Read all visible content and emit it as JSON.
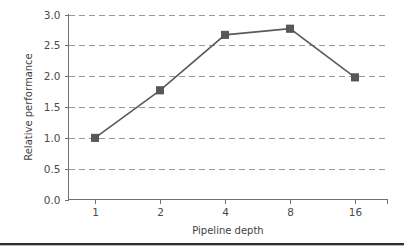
{
  "chart_data": {
    "type": "line",
    "title": "",
    "xlabel": "Pipeline depth",
    "ylabel": "Relative performance",
    "categories": [
      "1",
      "2",
      "4",
      "8",
      "16"
    ],
    "values": [
      1.0,
      1.77,
      2.67,
      2.77,
      1.98
    ],
    "x_tick_labels": [
      "1",
      "2",
      "4",
      "8",
      "16"
    ],
    "y_tick_labels": [
      "0.0",
      "0.5",
      "1.0",
      "1.5",
      "2.0",
      "2.5",
      "3.0"
    ],
    "y_tick_values": [
      0.0,
      0.5,
      1.0,
      1.5,
      2.0,
      2.5,
      3.0
    ],
    "ylim": [
      0.0,
      3.0
    ],
    "grid": "horizontal-dashed",
    "legend": "none",
    "marker": "square",
    "line_color": "#5a5a5a",
    "marker_color": "#585858",
    "grid_color": "#9a9a9a",
    "axis_color": "#6f6f6f",
    "background_color": "#ffffff"
  },
  "figure": {
    "bottom_rule_color": "#2f2f33"
  }
}
